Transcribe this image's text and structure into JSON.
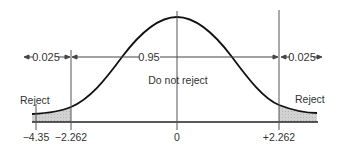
{
  "diagram": {
    "type": "t-distribution two-tailed rejection regions",
    "labels": {
      "left_tail_prob": "0.025",
      "center_prob": "0.95",
      "right_tail_prob": "0.025",
      "center_region": "Do not reject",
      "left_reject": "Reject",
      "right_reject": "Reject"
    },
    "axis_ticks": [
      {
        "label": "−4.35",
        "value": -4.35
      },
      {
        "label": "−2.262",
        "value": -2.262
      },
      {
        "label": "0",
        "value": 0
      },
      {
        "label": "+2.262",
        "value": 2.262
      }
    ],
    "colors": {
      "curve": "#111111",
      "lines": "#555555",
      "shading": "#c8c8c8",
      "text": "#333333"
    }
  }
}
